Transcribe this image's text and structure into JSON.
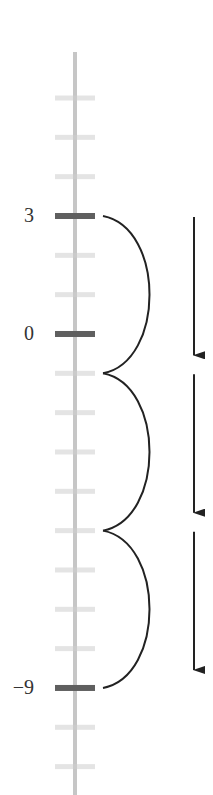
{
  "diagram": {
    "type": "vertical-number-line",
    "orientation": "vertical",
    "min_value": -11,
    "max_value": 6,
    "tick_values": [
      6,
      5,
      4,
      3,
      2,
      1,
      0,
      -1,
      -2,
      -3,
      -4,
      -5,
      -6,
      -7,
      -8,
      -9,
      -10,
      -11
    ],
    "highlighted_ticks": [
      3,
      0,
      -9
    ],
    "labels": [
      {
        "value": 3,
        "text": "3"
      },
      {
        "value": 0,
        "text": "0"
      },
      {
        "value": -9,
        "text": "−9"
      }
    ],
    "jumps": [
      {
        "from": 3,
        "to": -1,
        "step": -4
      },
      {
        "from": -1,
        "to": -5,
        "step": -4
      },
      {
        "from": -5,
        "to": -9,
        "step": -4
      }
    ],
    "direction_arrows": [
      {
        "from": 3,
        "to": -1,
        "direction": "down"
      },
      {
        "from": -1,
        "to": -5,
        "direction": "down"
      },
      {
        "from": -5,
        "to": -9,
        "direction": "down"
      }
    ],
    "colors": {
      "axis_line": "#c6c6c6",
      "minor_tick": "#e4e4e4",
      "major_tick": "#5f5f5f",
      "jump_arc": "#222222",
      "arrow": "#222222",
      "label_text": "#333333"
    }
  }
}
